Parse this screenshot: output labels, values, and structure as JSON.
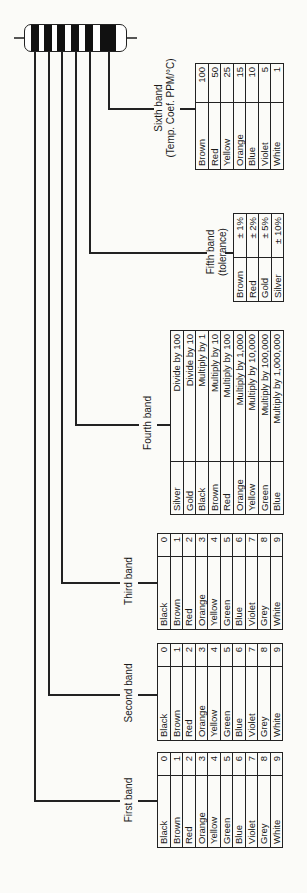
{
  "resistor": {
    "bands": 6,
    "band_color": "#111111"
  },
  "bands": [
    {
      "label": "First band",
      "rows": [
        {
          "color": "Black",
          "value": "0"
        },
        {
          "color": "Brown",
          "value": "1"
        },
        {
          "color": "Red",
          "value": "2"
        },
        {
          "color": "Orange",
          "value": "3"
        },
        {
          "color": "Yellow",
          "value": "4"
        },
        {
          "color": "Green",
          "value": "5"
        },
        {
          "color": "Blue",
          "value": "6"
        },
        {
          "color": "Violet",
          "value": "7"
        },
        {
          "color": "Grey",
          "value": "8"
        },
        {
          "color": "White",
          "value": "9"
        }
      ]
    },
    {
      "label": "Second band",
      "rows": [
        {
          "color": "Black",
          "value": "0"
        },
        {
          "color": "Brown",
          "value": "1"
        },
        {
          "color": "Red",
          "value": "2"
        },
        {
          "color": "Orange",
          "value": "3"
        },
        {
          "color": "Yellow",
          "value": "4"
        },
        {
          "color": "Green",
          "value": "5"
        },
        {
          "color": "Blue",
          "value": "6"
        },
        {
          "color": "Violet",
          "value": "7"
        },
        {
          "color": "Grey",
          "value": "8"
        },
        {
          "color": "White",
          "value": "9"
        }
      ]
    },
    {
      "label": "Third band",
      "rows": [
        {
          "color": "Black",
          "value": "0"
        },
        {
          "color": "Brown",
          "value": "1"
        },
        {
          "color": "Red",
          "value": "2"
        },
        {
          "color": "Orange",
          "value": "3"
        },
        {
          "color": "Yellow",
          "value": "4"
        },
        {
          "color": "Green",
          "value": "5"
        },
        {
          "color": "Blue",
          "value": "6"
        },
        {
          "color": "Violet",
          "value": "7"
        },
        {
          "color": "Grey",
          "value": "8"
        },
        {
          "color": "White",
          "value": "9"
        }
      ]
    },
    {
      "label": "Fourth band",
      "rows": [
        {
          "color": "Silver",
          "value": "Divide by 100"
        },
        {
          "color": "Gold",
          "value": "Divide by 10"
        },
        {
          "color": "Black",
          "value": "Multiply by 1"
        },
        {
          "color": "Brown",
          "value": "Multiply by 10"
        },
        {
          "color": "Red",
          "value": "Multiply by 100"
        },
        {
          "color": "Orange",
          "value": "Multiply by 1,000"
        },
        {
          "color": "Yellow",
          "value": "Multiply by 10,000"
        },
        {
          "color": "Green",
          "value": "Multiply by 100,000"
        },
        {
          "color": "Blue",
          "value": "Multiply by 1,000,000"
        }
      ]
    },
    {
      "label": "Fifth band",
      "sublabel": "(tolerance)",
      "rows": [
        {
          "color": "Brown",
          "value": "± 1%"
        },
        {
          "color": "Red",
          "value": "± 2%"
        },
        {
          "color": "Gold",
          "value": "± 5%"
        },
        {
          "color": "Silver",
          "value": "± 10%"
        }
      ]
    },
    {
      "label": "Sixth band",
      "sublabel": "(Temp. Coef. PPM/°C)",
      "rows": [
        {
          "color": "Brown",
          "value": "100"
        },
        {
          "color": "Red",
          "value": "50"
        },
        {
          "color": "Yellow",
          "value": "25"
        },
        {
          "color": "Orange",
          "value": "15"
        },
        {
          "color": "Blue",
          "value": "10"
        },
        {
          "color": "Violet",
          "value": "5"
        },
        {
          "color": "White",
          "value": "1"
        }
      ]
    }
  ]
}
